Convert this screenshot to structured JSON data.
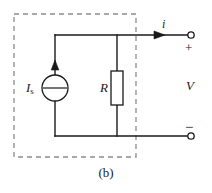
{
  "figure": {
    "caption": "(b)",
    "type": "circuit-diagram"
  },
  "labels": {
    "current_source": {
      "symbol": "I",
      "subscript": "s",
      "full": "Is"
    },
    "resistor": {
      "symbol": "R"
    },
    "port_current": {
      "symbol": "i"
    },
    "port_voltage": {
      "symbol": "V"
    },
    "terminal_positive": "+",
    "terminal_negative": "−"
  },
  "colors": {
    "wire": "#1a1a1a",
    "dashed_box": "#8c8c8c",
    "component_fill": "#ffffff",
    "text": "#1a1a1a",
    "background": "#ffffff"
  },
  "geometry": {
    "dashed_box": {
      "x": 14,
      "y": 14,
      "width": 122,
      "height": 143
    },
    "top_wire_y": 35,
    "bottom_wire_y": 136,
    "source_branch_x": 55,
    "resistor_branch_x": 117,
    "right_terminal_x": 193,
    "source_circle": {
      "cx": 55,
      "cy": 88,
      "r": 13
    },
    "resistor_rect": {
      "x": 111,
      "y": 71,
      "width": 12,
      "height": 34
    },
    "current_arrow_x": 158,
    "source_arrow_y": 68
  }
}
